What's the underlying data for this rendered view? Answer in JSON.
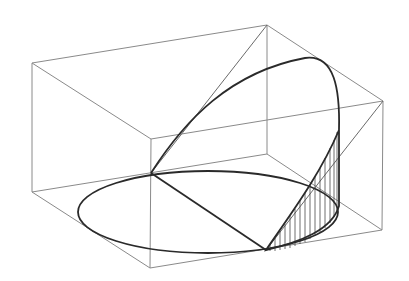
{
  "diagram": {
    "title": "",
    "colors": {
      "background": "#ffffff",
      "box_edges": "#8a8a8a",
      "curves": "#2a2a2a",
      "hatch": "#4a4a4a"
    },
    "box": {
      "top_face": [
        [
          32,
          63
        ],
        [
          267,
          25
        ],
        [
          383,
          101
        ],
        [
          151,
          139
        ]
      ],
      "bottom_face": [
        [
          32,
          192
        ],
        [
          267,
          154
        ],
        [
          382,
          230
        ],
        [
          150,
          268
        ]
      ]
    },
    "ellipse_base": {
      "cx": 208,
      "cy": 212,
      "rx": 130,
      "ry": 41
    },
    "labels": []
  }
}
